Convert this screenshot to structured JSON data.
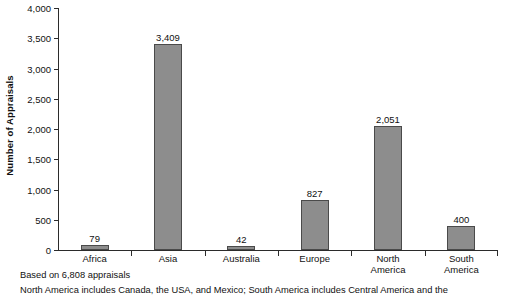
{
  "chart_data": {
    "type": "bar",
    "title": "",
    "xlabel": "",
    "ylabel": "Number of Appraisals",
    "ylim": [
      0,
      4000
    ],
    "ytick_step": 500,
    "grid": false,
    "legend": "none",
    "categories": [
      "Africa",
      "Asia",
      "Australia",
      "Europe",
      "North America",
      "South America"
    ],
    "values": [
      79,
      3409,
      42,
      827,
      2051,
      400
    ],
    "value_labels": [
      "79",
      "3,409",
      "42",
      "827",
      "2,051",
      "400"
    ],
    "ytick_labels": [
      "0",
      "500",
      "1,000",
      "1,500",
      "2,000",
      "2,500",
      "3,000",
      "3,500",
      "4,000"
    ],
    "ytick_values": [
      0,
      500,
      1000,
      1500,
      2000,
      2500,
      3000,
      3500,
      4000
    ],
    "bar_color": "#8d8d8d",
    "bar_border_color": "#4a4a4a",
    "axis_color": "#2b2b2b",
    "background_color": "#ffffff"
  },
  "category_label_lines": [
    [
      "Africa"
    ],
    [
      "Asia"
    ],
    [
      "Australia"
    ],
    [
      "Europe"
    ],
    [
      "North",
      "America"
    ],
    [
      "South",
      "America"
    ]
  ],
  "footnotes": [
    "Based on 6,808 appraisals",
    "North America includes Canada, the USA, and Mexico; South America includes Central America and the"
  ]
}
